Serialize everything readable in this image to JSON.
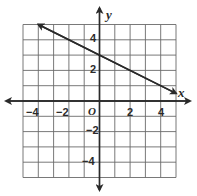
{
  "chart_data": {
    "type": "line",
    "title": "",
    "xlabel": "x",
    "ylabel": "y",
    "xlim": [
      -5,
      5
    ],
    "ylim": [
      -5,
      5
    ],
    "grid": true,
    "origin_label": "O",
    "x_tick_labels": [
      "-4",
      "-2",
      "2",
      "4"
    ],
    "x_tick_values": [
      -4,
      -2,
      2,
      4
    ],
    "y_tick_labels": [
      "4",
      "2",
      "-2",
      "-4"
    ],
    "y_tick_values": [
      4,
      2,
      -2,
      -4
    ],
    "series": [
      {
        "name": "line",
        "equation": "y = -0.5x + 3",
        "slope": -0.5,
        "intercept": 3,
        "x": [
          -4,
          5
        ],
        "y": [
          5,
          0.5
        ],
        "arrows": "both"
      }
    ]
  },
  "labels": {
    "x_axis": "x",
    "y_axis": "y",
    "origin": "O",
    "xt": [
      "−4",
      "−2",
      "2",
      "4"
    ],
    "yt": [
      "4",
      "2",
      "−2",
      "−4"
    ]
  }
}
